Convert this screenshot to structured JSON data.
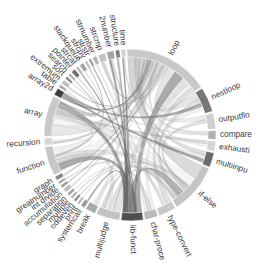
{
  "diagram": {
    "type": "chord",
    "center": [
      130,
      135
    ],
    "inner_radius": 78,
    "outer_radius": 86,
    "label_radius": 90,
    "ring_color_default": "#bdbdbd",
    "groups": [
      {
        "id": "loop",
        "label": "loop",
        "start": -2,
        "end": 56,
        "color": "#c8c8c8"
      },
      {
        "id": "nestloop",
        "label": "nestloop",
        "start": 57,
        "end": 74,
        "color": "#777777"
      },
      {
        "id": "outputflo",
        "label": "outputflo",
        "start": 75,
        "end": 86,
        "color": "#cfcfcf"
      },
      {
        "id": "compare",
        "label": "compare",
        "start": 87,
        "end": 93,
        "color": "#b0b0b0"
      },
      {
        "id": "exhausti",
        "label": "exhausti",
        "start": 94,
        "end": 101,
        "color": "#d4d4d4"
      },
      {
        "id": "multiinpu",
        "label": "multiinpu",
        "start": 102,
        "end": 112,
        "color": "#6a6a6a"
      },
      {
        "id": "if-else",
        "label": "if-else",
        "start": 113,
        "end": 147,
        "color": "#c4c4c4"
      },
      {
        "id": "type-convert",
        "label": "type-convert",
        "start": 148,
        "end": 160,
        "color": "#c9c9c9"
      },
      {
        "id": "char-proce",
        "label": "char-proce",
        "start": 161,
        "end": 170,
        "color": "#bababa"
      },
      {
        "id": "lib-funct",
        "label": "lib-funct",
        "start": 171,
        "end": 186,
        "color": "#4f4f4f"
      },
      {
        "id": "multijudge",
        "label": "multijudge",
        "start": 187,
        "end": 203,
        "color": "#c2c2c2"
      },
      {
        "id": "break",
        "label": "break",
        "start": 204,
        "end": 211,
        "color": "#a8a8a8"
      },
      {
        "id": "systemcall",
        "label": "systemcall",
        "start": 212,
        "end": 215,
        "color": "#9a9a9a"
      },
      {
        "id": "print",
        "label": "print",
        "start": 216,
        "end": 218,
        "color": "#bdbdbd"
      },
      {
        "id": "oddeven",
        "label": "oddeven",
        "start": 219,
        "end": 221,
        "color": "#8e8e8e"
      },
      {
        "id": "multiple",
        "label": "multiple",
        "start": 222,
        "end": 224,
        "color": "#b6b6b6"
      },
      {
        "id": "separation",
        "label": "separation",
        "start": 225,
        "end": 227,
        "color": "#a0a0a0"
      },
      {
        "id": "accumulation",
        "label": "accumulation",
        "start": 228,
        "end": 231,
        "color": "#bcbcbc"
      },
      {
        "id": "int-divide",
        "label": "int divide",
        "start": 232,
        "end": 234,
        "color": "#999999"
      },
      {
        "id": "greatnumber",
        "label": "greatnumber",
        "start": 235,
        "end": 237,
        "color": "#aaaaaa"
      },
      {
        "id": "graph",
        "label": "graph",
        "start": 238,
        "end": 241,
        "color": "#888888"
      },
      {
        "id": "function",
        "label": "function",
        "start": 242,
        "end": 262,
        "color": "#c6c6c6"
      },
      {
        "id": "recursion",
        "label": "recursion",
        "start": 263,
        "end": 268,
        "color": "#d6d6d6"
      },
      {
        "id": "array",
        "label": "array",
        "start": 269,
        "end": 297,
        "color": "#c9c9c9"
      },
      {
        "id": "array2d",
        "label": "array2d",
        "start": 298,
        "end": 303,
        "color": "#3f3f3f"
      },
      {
        "id": "table",
        "label": "table",
        "start": 304,
        "end": 306,
        "color": "#a6a6a6"
      },
      {
        "id": "extremum",
        "label": "extremum",
        "start": 307,
        "end": 310,
        "color": "#bfbfbf"
      },
      {
        "id": "sort",
        "label": "sort",
        "start": 311,
        "end": 313,
        "color": "#8a8a8a"
      },
      {
        "id": "search",
        "label": "search",
        "start": 314,
        "end": 316,
        "color": "#b3b3b3"
      },
      {
        "id": "pointer",
        "label": "pointer",
        "start": 317,
        "end": 320,
        "color": "#6e6e6e"
      },
      {
        "id": "strcat",
        "label": "strcat",
        "start": 321,
        "end": 323,
        "color": "#b8b8b8"
      },
      {
        "id": "stackqueue",
        "label": "stackqueue",
        "start": 324,
        "end": 327,
        "color": "#a2a2a2"
      },
      {
        "id": "strcpy",
        "label": "strcpy",
        "start": 328,
        "end": 330,
        "color": "#c0c0c0"
      },
      {
        "id": "strstr",
        "label": "strstr",
        "start": 331,
        "end": 333,
        "color": "#9c9c9c"
      },
      {
        "id": "strnumber",
        "label": "strnumber",
        "start": 334,
        "end": 337,
        "color": "#b4b4b4"
      },
      {
        "id": "strcmp",
        "label": "strcmp",
        "start": 338,
        "end": 343,
        "color": "#c3c3c3"
      },
      {
        "id": "2number",
        "label": "2number",
        "start": 344,
        "end": 349,
        "color": "#a4a4a4"
      },
      {
        "id": "structure",
        "label": "structure",
        "start": 350,
        "end": 353,
        "color": "#7c7c7c"
      },
      {
        "id": "time",
        "label": "time",
        "start": 354,
        "end": 357,
        "color": "#d0d0d0"
      }
    ],
    "ribbons": [
      [
        "loop",
        "if-else",
        10
      ],
      [
        "loop",
        "array",
        9
      ],
      [
        "loop",
        "function",
        7
      ],
      [
        "loop",
        "nestloop",
        5
      ],
      [
        "loop",
        "lib-funct",
        6
      ],
      [
        "loop",
        "multijudge",
        5
      ],
      [
        "loop",
        "char-proce",
        3
      ],
      [
        "loop",
        "type-convert",
        3
      ],
      [
        "loop",
        "break",
        3
      ],
      [
        "loop",
        "multiinpu",
        3
      ],
      [
        "loop",
        "outputflo",
        3
      ],
      [
        "loop",
        "strcmp",
        2
      ],
      [
        "loop",
        "array2d",
        2
      ],
      [
        "loop",
        "recursion",
        2
      ],
      [
        "loop",
        "compare",
        2
      ],
      [
        "if-else",
        "array",
        6
      ],
      [
        "if-else",
        "function",
        5
      ],
      [
        "if-else",
        "lib-funct",
        4
      ],
      [
        "if-else",
        "multijudge",
        3
      ],
      [
        "if-else",
        "break",
        2
      ],
      [
        "if-else",
        "nestloop",
        3
      ],
      [
        "array",
        "function",
        5
      ],
      [
        "array",
        "lib-funct",
        4
      ],
      [
        "array",
        "multiinpu",
        3
      ],
      [
        "array",
        "exhausti",
        2
      ],
      [
        "array",
        "type-convert",
        2
      ],
      [
        "function",
        "lib-funct",
        4
      ],
      [
        "function",
        "multijudge",
        3
      ],
      [
        "function",
        "recursion",
        2
      ],
      [
        "lib-funct",
        "time",
        3
      ],
      [
        "lib-funct",
        "structure",
        2
      ],
      [
        "lib-funct",
        "2number",
        2
      ],
      [
        "multiinpu",
        "array2d",
        2
      ],
      [
        "nestloop",
        "array2d",
        2
      ],
      [
        "compare",
        "sort",
        1
      ],
      [
        "multijudge",
        "char-proce",
        2
      ],
      [
        "char-proce",
        "strcmp",
        2
      ],
      [
        "strcpy",
        "function",
        1
      ],
      [
        "pointer",
        "array",
        1
      ],
      [
        "graph",
        "loop",
        1
      ],
      [
        "accumulation",
        "loop",
        1
      ],
      [
        "separation",
        "if-else",
        1
      ],
      [
        "oddeven",
        "if-else",
        1
      ],
      [
        "print",
        "loop",
        1
      ],
      [
        "systemcall",
        "lib-funct",
        1
      ],
      [
        "stackqueue",
        "array",
        1
      ],
      [
        "strstr",
        "lib-funct",
        1
      ],
      [
        "strnumber",
        "type-convert",
        1
      ],
      [
        "extremum",
        "loop",
        1
      ],
      [
        "table",
        "array",
        1
      ],
      [
        "search",
        "array",
        1
      ],
      [
        "greatnumber",
        "if-else",
        1
      ],
      [
        "int-divide",
        "loop",
        1
      ],
      [
        "multiple",
        "if-else",
        1
      ],
      [
        "strcat",
        "lib-funct",
        1
      ],
      [
        "time",
        "loop",
        2
      ],
      [
        "structure",
        "array",
        1
      ],
      [
        "2number",
        "if-else",
        1
      ],
      [
        "exhausti",
        "nestloop",
        2
      ],
      [
        "outputflo",
        "if-else",
        2
      ]
    ]
  }
}
